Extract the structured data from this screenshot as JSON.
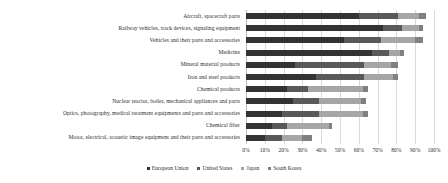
{
  "chart_data": {
    "type": "bar",
    "orientation": "horizontal",
    "stacked": true,
    "title": "",
    "xlabel": "",
    "ylabel": "",
    "xlim": [
      0,
      100
    ],
    "xtick_labels": [
      "0%",
      "10%",
      "20%",
      "30%",
      "40%",
      "50%",
      "60%",
      "70%",
      "80%",
      "90%",
      "100%"
    ],
    "xtick_values": [
      0,
      10,
      20,
      30,
      40,
      50,
      60,
      70,
      80,
      90,
      100
    ],
    "grid": true,
    "legend_position": "bottom",
    "categories": [
      "Aircraft, spacecraft parts",
      "Railway vehicles, track devices, signaling equipment",
      "Vehicles and their parts and accessories",
      "Medicine",
      "Mineral material products",
      "Iron and steel products",
      "Chemical products",
      "Nuclear reactor, boiler, mechanical appliances and parts",
      "Optics, photography, medical treatment equipments and parts and accessories",
      "Chemical fiber",
      "Motor, electrical, acoustic image equipment and their parts and accessories"
    ],
    "series": [
      {
        "name": "European Union",
        "color": "#333333",
        "values": [
          60,
          73,
          52,
          67,
          26,
          37,
          22,
          25,
          19,
          14,
          10
        ]
      },
      {
        "name": "United States",
        "color": "#595959",
        "values": [
          21,
          10,
          20,
          9,
          37,
          26,
          11,
          14,
          20,
          8,
          9
        ]
      },
      {
        "name": "Japan",
        "color": "#a6a6a6",
        "values": [
          11,
          9,
          18,
          6,
          14,
          15,
          29,
          22,
          23,
          22,
          11
        ]
      },
      {
        "name": "South Korea",
        "color": "#808080",
        "values": [
          4,
          2,
          4,
          2,
          4,
          3,
          3,
          3,
          3,
          2,
          5
        ]
      }
    ]
  },
  "legend": {
    "items": [
      {
        "label": "European Union",
        "color": "#333333"
      },
      {
        "label": "United States",
        "color": "#595959"
      },
      {
        "label": "Japan",
        "color": "#a6a6a6"
      },
      {
        "label": "South Korea",
        "color": "#808080"
      }
    ]
  }
}
